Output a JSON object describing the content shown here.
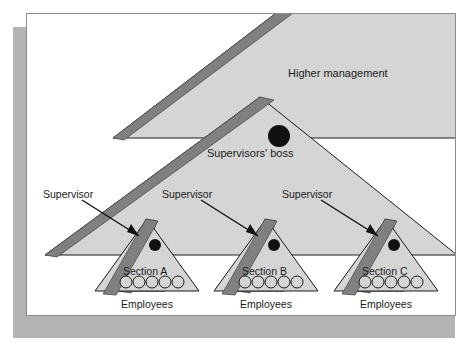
{
  "figure": {
    "kind": "organisational-hierarchy-diagram"
  },
  "colors": {
    "page_background": "#ffffff",
    "page_border": "#8c8c8c",
    "drop_shadow": "#b3b3b3",
    "triangle_fill": "#d5d5d5",
    "triangle_outline": "#1a1a1a",
    "band_fill": "#808080",
    "band_outline": "#4d4d4d",
    "person_dot": "#111111",
    "employee_circle_stroke": "#1a1a1a",
    "employee_circle_fill": "#d5d5d5",
    "label_text": "#1a1a1a",
    "leader_arrow": "#111111"
  },
  "labels": {
    "higher_management": "Higher management",
    "supervisors_boss": "Supervisors' boss"
  },
  "supervisor_labels": [
    {
      "text": "Supervisor"
    },
    {
      "text": "Supervisor"
    },
    {
      "text": "Supervisor"
    }
  ],
  "sections": [
    {
      "name": "Section A",
      "employees_label": "Employees",
      "employee_count": 5
    },
    {
      "name": "Section B",
      "employees_label": "Employees",
      "employee_count": 5
    },
    {
      "name": "Section C",
      "employees_label": "Employees",
      "employee_count": 5
    }
  ]
}
